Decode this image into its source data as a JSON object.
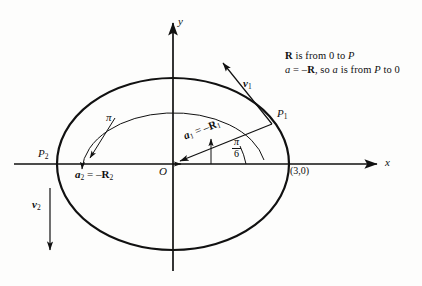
{
  "figure": {
    "background_color": "#fdfdfc",
    "ink_color": "#111111"
  },
  "axes": {
    "x_label": "x",
    "y_label": "y",
    "origin_label": "O"
  },
  "points": {
    "p1_label": "P",
    "p1_sub": "1",
    "p2_label": "P",
    "p2_sub": "2",
    "vertex_label": "(3,0)"
  },
  "vectors": {
    "v1_label": "v",
    "v1_sub": "1",
    "v2_label": "v",
    "v2_sub": "2",
    "a1_label": "a",
    "a1_sub": "1",
    "a1_eq": " = –",
    "a1_rhs": "R",
    "a1_rhs_sub": "1",
    "a2_label": "a",
    "a2_sub": "2",
    "a2_eq": " = –",
    "a2_rhs": "R",
    "a2_rhs_sub": "2"
  },
  "angles": {
    "pi_arc_label": "π",
    "pi_over_six_num": "π",
    "pi_over_six_den": "6"
  },
  "annotation": {
    "line1_a": "R",
    "line1_b": " is from 0 to ",
    "line1_c": "P",
    "line2_a": "a",
    "line2_b": " = –",
    "line2_c": "R",
    "line2_d": ", so ",
    "line2_e": "a",
    "line2_f": " is from ",
    "line2_g": "P",
    "line2_h": " to 0"
  },
  "geometry": {
    "ellipse_center_x": 173,
    "ellipse_center_y": 164,
    "ellipse_rx": 116,
    "ellipse_ry": 86,
    "inner_arc_rx": 92,
    "inner_arc_ry": 59,
    "x_axis_y": 164,
    "y_axis_x": 173,
    "p1_x": 272,
    "p1_y": 124,
    "p2_x": 57,
    "p2_y": 164
  }
}
